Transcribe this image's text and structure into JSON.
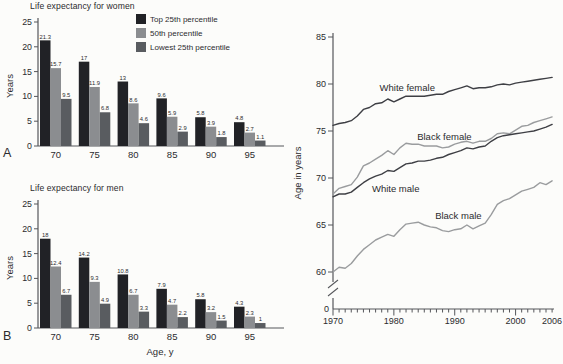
{
  "figure": {
    "background": "#fcfcfa",
    "text_color": "#2b2b2e",
    "axis_color": "#55565a"
  },
  "chart_data": [
    {
      "id": "women",
      "type": "bar",
      "panel_label": "A",
      "title": "Life expectancy for women",
      "xlabel": "",
      "ylabel": "Years",
      "ylim": [
        0,
        25
      ],
      "yticks": [
        0,
        5,
        10,
        15,
        20,
        25
      ],
      "grid": false,
      "legend_position": "top-right",
      "categories": [
        "70",
        "75",
        "80",
        "85",
        "90",
        "95"
      ],
      "series": [
        {
          "name": "Top 25th percentile",
          "color": "#212226",
          "values": [
            21.3,
            17,
            13,
            9.6,
            5.8,
            4.8
          ]
        },
        {
          "name": "50th percentile",
          "color": "#8b8d90",
          "values": [
            15.7,
            11.9,
            8.6,
            5.9,
            3.9,
            2.7
          ]
        },
        {
          "name": "Lowest 25th percentile",
          "color": "#595c60",
          "values": [
            9.5,
            6.8,
            4.6,
            2.9,
            1.8,
            1.1
          ]
        }
      ]
    },
    {
      "id": "men",
      "type": "bar",
      "panel_label": "B",
      "title": "Life expectancy for men",
      "xlabel": "Age, y",
      "ylabel": "Years",
      "ylim": [
        0,
        25
      ],
      "yticks": [
        0,
        5,
        10,
        15,
        20,
        25
      ],
      "grid": false,
      "categories": [
        "70",
        "75",
        "80",
        "85",
        "90",
        "95"
      ],
      "series": [
        {
          "name": "Top 25th percentile",
          "color": "#212226",
          "values": [
            18,
            14.2,
            10.8,
            7.9,
            5.8,
            4.3
          ]
        },
        {
          "name": "50th percentile",
          "color": "#8b8d90",
          "values": [
            12.4,
            9.3,
            6.7,
            4.7,
            3.2,
            2.3
          ]
        },
        {
          "name": "Lowest 25th percentile",
          "color": "#595c60",
          "values": [
            6.7,
            4.9,
            3.3,
            2.2,
            1.5,
            1
          ]
        }
      ]
    },
    {
      "id": "trend",
      "type": "line",
      "title": "",
      "xlabel": "",
      "ylabel": "Age in years",
      "ylim": [
        60,
        85
      ],
      "yticks": [
        60,
        65,
        70,
        75,
        80,
        85
      ],
      "axis_break": true,
      "origin_label": "0",
      "grid": false,
      "x": [
        1970,
        1971,
        1972,
        1973,
        1974,
        1975,
        1976,
        1977,
        1978,
        1979,
        1980,
        1981,
        1982,
        1983,
        1984,
        1985,
        1986,
        1987,
        1988,
        1989,
        1990,
        1991,
        1992,
        1993,
        1994,
        1995,
        1996,
        1997,
        1998,
        1999,
        2000,
        2001,
        2002,
        2003,
        2004,
        2005,
        2006
      ],
      "xticks_labeled": [
        1970,
        1980,
        1990,
        2000,
        2006
      ],
      "series": [
        {
          "name": "White female",
          "color": "#3e3f44",
          "label_pos": [
            1982.2,
            79.6
          ],
          "values": [
            75.6,
            75.8,
            75.9,
            76.1,
            76.6,
            77.3,
            77.5,
            77.9,
            78.0,
            78.4,
            78.1,
            78.4,
            78.7,
            78.7,
            78.7,
            78.7,
            78.8,
            78.9,
            78.9,
            79.2,
            79.4,
            79.6,
            79.8,
            79.5,
            79.6,
            79.6,
            79.7,
            79.9,
            80.0,
            79.9,
            80.1,
            80.2,
            80.3,
            80.4,
            80.5,
            80.6,
            80.7
          ]
        },
        {
          "name": "Black female",
          "color": "#9a9c9e",
          "label_pos": [
            1988.3,
            74.35
          ],
          "values": [
            68.3,
            68.9,
            69.1,
            69.3,
            70.1,
            71.3,
            71.6,
            72.0,
            72.4,
            72.9,
            72.5,
            73.2,
            73.7,
            73.6,
            73.6,
            73.4,
            73.4,
            73.4,
            73.2,
            73.3,
            73.6,
            73.8,
            73.9,
            73.7,
            73.9,
            73.9,
            74.2,
            74.7,
            74.8,
            74.7,
            75.1,
            75.5,
            75.6,
            75.9,
            76.1,
            76.3,
            76.5
          ]
        },
        {
          "name": "White male",
          "color": "#3e3f44",
          "label_pos": [
            1980.3,
            68.85
          ],
          "values": [
            68.0,
            68.3,
            68.3,
            68.5,
            69.0,
            69.5,
            69.9,
            70.2,
            70.4,
            70.8,
            70.7,
            71.1,
            71.5,
            71.6,
            71.8,
            71.8,
            71.9,
            72.1,
            72.2,
            72.5,
            72.7,
            72.9,
            73.2,
            73.1,
            73.3,
            73.4,
            73.9,
            74.3,
            74.5,
            74.6,
            74.7,
            74.8,
            74.9,
            75.0,
            75.2,
            75.4,
            75.7
          ]
        },
        {
          "name": "Black male",
          "color": "#9a9c9e",
          "label_pos": [
            1990.6,
            65.95
          ],
          "values": [
            60.0,
            60.5,
            60.4,
            60.9,
            61.7,
            62.4,
            62.9,
            63.4,
            63.7,
            64.0,
            63.8,
            64.5,
            65.1,
            65.2,
            65.3,
            65.0,
            64.8,
            64.7,
            64.4,
            64.3,
            64.5,
            64.6,
            65.0,
            64.6,
            64.9,
            65.2,
            66.1,
            67.2,
            67.6,
            67.8,
            68.2,
            68.6,
            68.8,
            69.0,
            69.5,
            69.3,
            69.7
          ]
        }
      ]
    }
  ]
}
